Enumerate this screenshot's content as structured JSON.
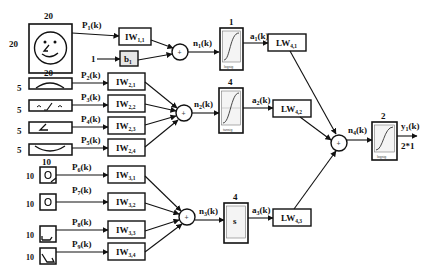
{
  "diagram": {
    "colors": {
      "stroke": "#111111",
      "background": "#ffffff",
      "bias_fill": "#e6e6e6",
      "tf_inner": "#f2f2f2"
    },
    "inputs": [
      {
        "id": "P1",
        "label": "P",
        "sub": "1",
        "suffix": "(k)",
        "size_top": "20",
        "size_left": "20",
        "icon": "face-icon"
      },
      {
        "id": "P2",
        "label": "P",
        "sub": "2",
        "suffix": "(k)",
        "size_top": "20",
        "size_left": "5",
        "icon": "eyebrow-icon"
      },
      {
        "id": "P3",
        "label": "P",
        "sub": "3",
        "suffix": "(k)",
        "size_left": "5",
        "icon": "eyes-nose-icon"
      },
      {
        "id": "P4",
        "label": "P",
        "sub": "4",
        "suffix": "(k)",
        "size_left": "5",
        "icon": "nose-icon"
      },
      {
        "id": "P5",
        "label": "P",
        "sub": "5",
        "suffix": "(k)",
        "size_left": "5",
        "icon": "mouth-icon"
      },
      {
        "id": "P6",
        "label": "P",
        "sub": "6",
        "suffix": "(k)",
        "size_top": "10",
        "size_left": "10",
        "icon": "eye-icon"
      },
      {
        "id": "P7",
        "label": "P",
        "sub": "7",
        "suffix": "(k)",
        "size_left": "10",
        "icon": "eye-icon"
      },
      {
        "id": "P8",
        "label": "P",
        "sub": "8",
        "suffix": "(k)",
        "size_left": "10",
        "icon": "corner-icon"
      },
      {
        "id": "P9",
        "label": "P",
        "sub": "9",
        "suffix": "(k)",
        "size_left": "10",
        "icon": "corner-icon"
      }
    ],
    "bias": {
      "input": "1",
      "label": "b",
      "sub": "1"
    },
    "input_weights": [
      {
        "label": "IW",
        "sub": "1,1"
      },
      {
        "label": "IW",
        "sub": "2,1"
      },
      {
        "label": "IW",
        "sub": "2,2"
      },
      {
        "label": "IW",
        "sub": "2,3"
      },
      {
        "label": "IW",
        "sub": "2,4"
      },
      {
        "label": "IW",
        "sub": "3,1"
      },
      {
        "label": "IW",
        "sub": "3,2"
      },
      {
        "label": "IW",
        "sub": "3,3"
      },
      {
        "label": "IW",
        "sub": "3,4"
      }
    ],
    "sum_symbol": "+",
    "net_inputs": [
      {
        "label": "n",
        "sub": "1",
        "suffix": "(k)"
      },
      {
        "label": "n",
        "sub": "2",
        "suffix": "(k)"
      },
      {
        "label": "n",
        "sub": "3",
        "suffix": "(k)"
      },
      {
        "label": "n",
        "sub": "4",
        "suffix": "(k)"
      }
    ],
    "transfer_functions": [
      {
        "size": "1",
        "name": "logsig"
      },
      {
        "size": "4",
        "name": "tansig"
      },
      {
        "size": "4",
        "name": "softmax",
        "glyph": "s"
      },
      {
        "size": "2",
        "name": "logsig"
      }
    ],
    "layer_outputs": [
      {
        "label": "a",
        "sub": "1",
        "suffix": "(k)"
      },
      {
        "label": "a",
        "sub": "2",
        "suffix": "(k)"
      },
      {
        "label": "a",
        "sub": "3",
        "suffix": "(k)"
      }
    ],
    "layer_weights": [
      {
        "label": "LW",
        "sub": "4,1"
      },
      {
        "label": "LW",
        "sub": "4,2"
      },
      {
        "label": "LW",
        "sub": "4,3"
      }
    ],
    "output": {
      "label": "y",
      "sub": "1",
      "suffix": "(k)",
      "dims": "2*1"
    }
  }
}
